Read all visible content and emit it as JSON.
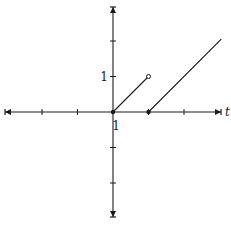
{
  "chart_data": {
    "type": "line",
    "title": "",
    "xlabel": "t",
    "ylabel": "",
    "xlim": [
      -3.1,
      3.1
    ],
    "ylim": [
      -3.1,
      3.1
    ],
    "grid": false,
    "x_ticks": [
      -3,
      -2,
      -1,
      1,
      2,
      3
    ],
    "y_ticks": [
      -3,
      -2,
      -1,
      1,
      2,
      3
    ],
    "tick_labels": {
      "x": [
        "1"
      ],
      "y": [
        "1"
      ]
    },
    "series": [
      {
        "name": "segment-1",
        "points": [
          [
            0,
            0
          ],
          [
            1,
            1
          ]
        ],
        "start_marker": "filled",
        "end_marker": "open"
      },
      {
        "name": "segment-2",
        "points": [
          [
            1,
            0
          ],
          [
            3.05,
            2.05
          ]
        ],
        "start_marker": "filled",
        "end_marker": "none"
      }
    ],
    "colors": {
      "axis": "#1a1a1a",
      "line": "#1a1a1a",
      "background": "#ffffff"
    }
  },
  "labels": {
    "x_axis_name": "t",
    "x_tick_one": "1",
    "y_tick_one": "1"
  }
}
